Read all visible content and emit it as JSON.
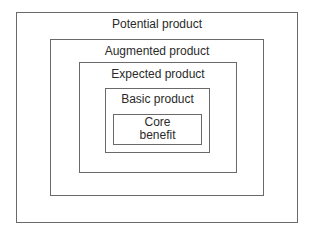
{
  "diagram": {
    "type": "nested-boxes",
    "levels": [
      {
        "label": "Potential product"
      },
      {
        "label": "Augmented product"
      },
      {
        "label": "Expected product"
      },
      {
        "label": "Basic product"
      },
      {
        "label_line1": "Core",
        "label_line2": "benefit"
      }
    ],
    "colors": {
      "border": "#6a6a6a",
      "text": "#2a2a2a",
      "background": "#ffffff"
    }
  }
}
